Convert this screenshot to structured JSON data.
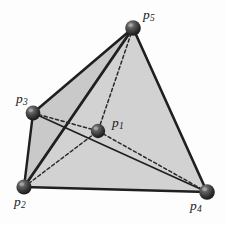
{
  "figure": {
    "type": "geometry-diagram",
    "canvas": {
      "width": 225,
      "height": 225
    },
    "colors": {
      "background": "#fdfdfd",
      "face_fill": "#c9c9c9",
      "face_fill_light": "#d2d2d2",
      "edge_solid": "#1f1f1f",
      "edge_dashed": "#2a2a2a",
      "vertex_dark": "#2b2b2b",
      "vertex_mid": "#555555",
      "vertex_highlight": "#b0b0b0",
      "label_color": "#1a1a1a"
    },
    "vertices": [
      {
        "id": "p1",
        "letter": "p",
        "index": "1",
        "x": 98,
        "y": 131,
        "r": 7.2,
        "label_x": 112,
        "label_y": 116,
        "hidden": true
      },
      {
        "id": "p2",
        "letter": "p",
        "index": "2",
        "x": 24,
        "y": 187,
        "r": 7.6,
        "label_x": 14,
        "label_y": 195,
        "hidden": false
      },
      {
        "id": "p3",
        "letter": "p",
        "index": "3",
        "x": 33,
        "y": 113,
        "r": 7.4,
        "label_x": 16,
        "label_y": 92,
        "hidden": false
      },
      {
        "id": "p4",
        "letter": "p",
        "index": "4",
        "x": 207,
        "y": 192,
        "r": 7.8,
        "label_x": 190,
        "label_y": 199,
        "hidden": false
      },
      {
        "id": "p5",
        "letter": "p",
        "index": "5",
        "x": 133,
        "y": 28,
        "r": 7.8,
        "label_x": 143,
        "label_y": 8,
        "hidden": false
      }
    ],
    "edges": [
      {
        "id": "p5-p3",
        "from": "p5",
        "to": "p3",
        "style": "solid",
        "width": 2.6
      },
      {
        "id": "p5-p2",
        "from": "p5",
        "to": "p2",
        "style": "solid",
        "width": 2.8
      },
      {
        "id": "p5-p4",
        "from": "p5",
        "to": "p4",
        "style": "solid",
        "width": 2.6
      },
      {
        "id": "p3-p2",
        "from": "p3",
        "to": "p2",
        "style": "solid",
        "width": 2.4
      },
      {
        "id": "p2-p4",
        "from": "p2",
        "to": "p4",
        "style": "solid",
        "width": 2.6
      },
      {
        "id": "p3-p4",
        "from": "p3",
        "to": "p4",
        "style": "solid",
        "width": 1.7
      },
      {
        "id": "p5-p1",
        "from": "p5",
        "to": "p1",
        "style": "dashed",
        "width": 1.5
      },
      {
        "id": "p3-p1",
        "from": "p3",
        "to": "p1",
        "style": "dashed",
        "width": 1.5
      },
      {
        "id": "p2-p1",
        "from": "p2",
        "to": "p1",
        "style": "dashed",
        "width": 1.5
      },
      {
        "id": "p1-p4",
        "from": "p1",
        "to": "p4",
        "style": "dashed",
        "width": 1.5
      }
    ],
    "faces": [
      {
        "id": "face-p5-p3-p2",
        "vertices": [
          "p5",
          "p3",
          "p2"
        ],
        "shade": "face_fill"
      },
      {
        "id": "face-p5-p2-p4",
        "vertices": [
          "p5",
          "p2",
          "p4"
        ],
        "shade": "face_fill_light"
      }
    ],
    "dash_pattern": "3.2 2.6"
  }
}
